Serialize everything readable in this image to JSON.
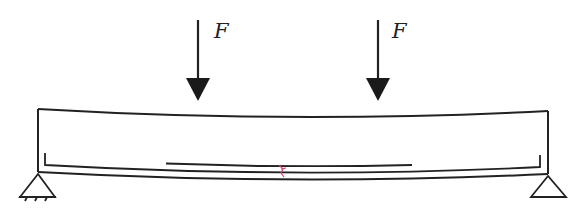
{
  "diagram": {
    "loads": [
      {
        "label": "F",
        "x": 198,
        "direction": "down"
      },
      {
        "label": "F",
        "x": 378,
        "direction": "down"
      }
    ],
    "beam": {
      "left_x": 38,
      "right_x": 548,
      "top_y": 109,
      "bottom_y": 173,
      "deflected": true
    },
    "supports": [
      {
        "type": "pinned",
        "x": 38
      },
      {
        "type": "roller",
        "x": 548
      }
    ],
    "reinforcement": {
      "main_bar": "bottom longitudinal bar with end hooks",
      "additional_bar": "mid-span bar"
    },
    "crack": {
      "x": 282,
      "color": "#d9426a"
    },
    "colors": {
      "line": "#222222",
      "crack": "#d9426a",
      "background": "#ffffff"
    }
  }
}
